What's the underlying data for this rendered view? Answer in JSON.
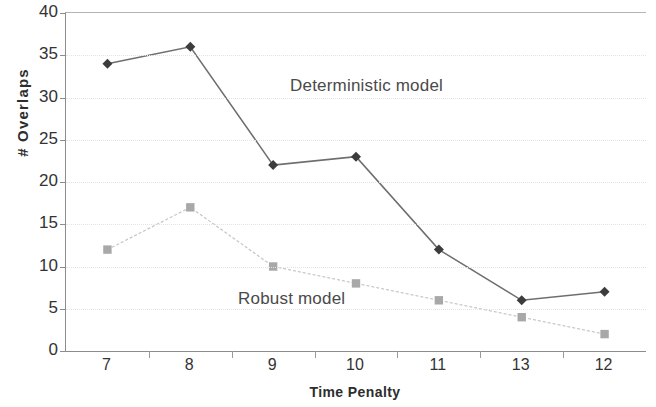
{
  "chart_data": {
    "type": "line",
    "title": "",
    "xlabel": "Time Penalty",
    "ylabel": "# Overlaps",
    "categories": [
      "7",
      "8",
      "9",
      "10",
      "11",
      "13",
      "12"
    ],
    "ylim": [
      0,
      40
    ],
    "yticks": [
      0,
      5,
      10,
      15,
      20,
      25,
      30,
      35,
      40
    ],
    "ytick_labels": [
      "0",
      "5",
      "10",
      "15",
      "20",
      "25",
      "30",
      "35",
      "40"
    ],
    "grid": true,
    "legend_position": "inline-annotation",
    "series": [
      {
        "name": "Deterministic model",
        "marker": "diamond",
        "color": "#3c3c3c",
        "line_color": "#6e6e6e",
        "values": [
          34,
          36,
          22,
          23,
          12,
          6,
          7
        ]
      },
      {
        "name": "Robust model",
        "marker": "square",
        "color": "#a8a8a8",
        "line_color": "#c4c4c4",
        "values": [
          12,
          17,
          10,
          8,
          6,
          4,
          2
        ]
      }
    ],
    "annotations": [
      {
        "text": "Deterministic model",
        "series": "Deterministic model"
      },
      {
        "text": "Robust model",
        "series": "Robust model"
      }
    ]
  }
}
